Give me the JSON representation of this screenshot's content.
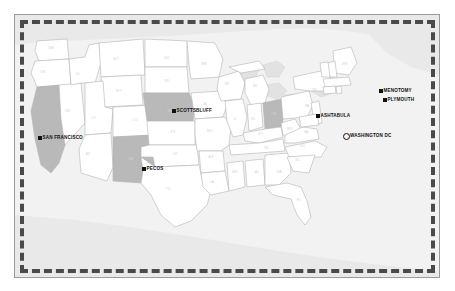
{
  "figure": {
    "type": "map",
    "region": "United States",
    "projection_note": "contiguous United States outline"
  },
  "cities": [
    {
      "name": "SAN FRANCISCO",
      "marker": "filled-square",
      "x": 23,
      "y": 121,
      "state": "CA"
    },
    {
      "name": "PECOS",
      "marker": "filled-square",
      "x": 127,
      "y": 152,
      "state": "NM"
    },
    {
      "name": "SCOTTSBLUFF",
      "marker": "filled-square",
      "x": 157,
      "y": 94,
      "state": "NE"
    },
    {
      "name": "ASHTABULA",
      "marker": "filled-square",
      "x": 301,
      "y": 99,
      "state": "OH"
    },
    {
      "name": "MENOTOMY",
      "marker": "filled-square",
      "x": 364,
      "y": 74,
      "state": "MA"
    },
    {
      "name": "PLYMOUTH",
      "marker": "filled-square",
      "x": 368,
      "y": 83,
      "state": "MA"
    },
    {
      "name": "WASHINGTON DC",
      "marker": "hollow-circle",
      "x": 329,
      "y": 119,
      "state": "DC"
    }
  ],
  "highlighted_states": [
    "CA",
    "NE",
    "NM",
    "OH"
  ],
  "colors": {
    "highlight_fill": "#b9b9b9",
    "state_fill": "#ffffff",
    "state_stroke": "#b4b4b4",
    "background": "#f2f2f2",
    "border_dash": "#4a4a4a",
    "marker": "#111111",
    "abbr_text": "#d2d2d2"
  },
  "state_labels": [
    {
      "abbr": "WA",
      "x": 36,
      "y": 34
    },
    {
      "abbr": "OR",
      "x": 28,
      "y": 58
    },
    {
      "abbr": "CA",
      "x": 34,
      "y": 123
    },
    {
      "abbr": "NV",
      "x": 53,
      "y": 97
    },
    {
      "abbr": "ID",
      "x": 63,
      "y": 60
    },
    {
      "abbr": "MT",
      "x": 101,
      "y": 45
    },
    {
      "abbr": "WY",
      "x": 104,
      "y": 77
    },
    {
      "abbr": "UT",
      "x": 79,
      "y": 104
    },
    {
      "abbr": "AZ",
      "x": 73,
      "y": 140
    },
    {
      "abbr": "NM",
      "x": 116,
      "y": 145
    },
    {
      "abbr": "CO",
      "x": 120,
      "y": 106
    },
    {
      "abbr": "ND",
      "x": 152,
      "y": 44
    },
    {
      "abbr": "SD",
      "x": 152,
      "y": 67
    },
    {
      "abbr": "NE",
      "x": 155,
      "y": 97
    },
    {
      "abbr": "KS",
      "x": 158,
      "y": 118
    },
    {
      "abbr": "OK",
      "x": 160,
      "y": 140
    },
    {
      "abbr": "TX",
      "x": 153,
      "y": 175
    },
    {
      "abbr": "MN",
      "x": 189,
      "y": 50
    },
    {
      "abbr": "IA",
      "x": 190,
      "y": 90
    },
    {
      "abbr": "MO",
      "x": 195,
      "y": 117
    },
    {
      "abbr": "AR",
      "x": 196,
      "y": 143
    },
    {
      "abbr": "LA",
      "x": 197,
      "y": 168
    },
    {
      "abbr": "WI",
      "x": 212,
      "y": 70
    },
    {
      "abbr": "IL",
      "x": 220,
      "y": 105
    },
    {
      "abbr": "MS",
      "x": 220,
      "y": 158
    },
    {
      "abbr": "MI",
      "x": 240,
      "y": 72
    },
    {
      "abbr": "IN",
      "x": 238,
      "y": 105
    },
    {
      "abbr": "KY",
      "x": 246,
      "y": 120
    },
    {
      "abbr": "TN",
      "x": 251,
      "y": 134
    },
    {
      "abbr": "AL",
      "x": 242,
      "y": 158
    },
    {
      "abbr": "OH",
      "x": 259,
      "y": 100
    },
    {
      "abbr": "GA",
      "x": 264,
      "y": 158
    },
    {
      "abbr": "FL",
      "x": 284,
      "y": 186
    },
    {
      "abbr": "WV",
      "x": 275,
      "y": 115
    },
    {
      "abbr": "SC",
      "x": 283,
      "y": 146
    },
    {
      "abbr": "NC",
      "x": 288,
      "y": 132
    },
    {
      "abbr": "VA",
      "x": 291,
      "y": 118
    },
    {
      "abbr": "PA",
      "x": 292,
      "y": 92
    },
    {
      "abbr": "NY",
      "x": 300,
      "y": 76
    },
    {
      "abbr": "ME",
      "x": 330,
      "y": 50
    }
  ]
}
